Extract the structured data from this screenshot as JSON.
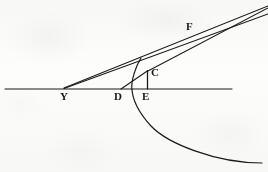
{
  "figure": {
    "canvas": {
      "width": 268,
      "height": 172
    },
    "background_color": "#fdfdfc",
    "ink_color": "#1a1a1a"
  },
  "labels": {
    "Y": {
      "text": "Y",
      "x": 60,
      "y": 91,
      "font_size": 11
    },
    "D": {
      "text": "D",
      "x": 114,
      "y": 91,
      "font_size": 11
    },
    "E": {
      "text": "E",
      "x": 142,
      "y": 91,
      "font_size": 11
    },
    "C": {
      "text": "C",
      "x": 151,
      "y": 67,
      "font_size": 11
    },
    "F": {
      "text": "F",
      "x": 186,
      "y": 21,
      "font_size": 11
    }
  },
  "points": {
    "Y": {
      "x": 65,
      "y": 88.5
    },
    "D": {
      "x": 121,
      "y": 89
    },
    "E": {
      "x": 147,
      "y": 89
    },
    "C": {
      "x": 148,
      "y": 71
    },
    "F": {
      "x": 192,
      "y": 33
    },
    "vertex": {
      "x": 131,
      "y": 86
    }
  },
  "segments": {
    "axis": {
      "name": "horizontal-axis",
      "x1": 5,
      "y1": 89,
      "x2": 232,
      "y2": 89,
      "stroke_width": 1.1
    },
    "ray_Y_through_C": {
      "name": "ray-y-c",
      "x1": 64,
      "y1": 88.5,
      "x2": 268,
      "y2": 14,
      "stroke_width": 1.1
    },
    "ray_Y_through_F": {
      "name": "ray-y-f",
      "x1": 64,
      "y1": 88,
      "x2": 268,
      "y2": 6,
      "stroke_width": 1.1
    },
    "chord_C_F": {
      "name": "chord-c-f",
      "x1": 147,
      "y1": 71.5,
      "x2": 268,
      "y2": 8,
      "stroke_width": 1.1
    },
    "chord_D_C": {
      "name": "chord-d-c",
      "x1": 121,
      "y1": 89,
      "x2": 148,
      "y2": 70.5,
      "stroke_width": 1.1
    },
    "ordinate_C_E": {
      "name": "ordinate-c-e",
      "x1": 147.5,
      "y1": 71,
      "x2": 147.5,
      "y2": 89,
      "stroke_width": 1.3
    }
  },
  "curve": {
    "name": "hyperbola-branch",
    "path": "M 141 58 C 136 66 131.5 79 131.8 87.5 C 132.2 99 139 113 151 126 C 167 143 215 163 262 163",
    "stroke_width": 1.2,
    "description": "Conic branch opening to the lower right, vertex near (132, 87), passing through C and sweeping down past E toward the lower-right corner"
  }
}
